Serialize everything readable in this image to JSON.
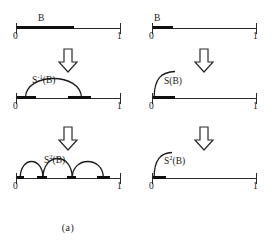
{
  "figure": {
    "axis": {
      "left_label": "0",
      "right_label": "1"
    },
    "arrow_icon": "down-block-arrow"
  },
  "panels": [
    {
      "id": "a",
      "caption": "(a)",
      "rows": [
        {
          "id": "a-row-1",
          "set_label": "B",
          "segments": [
            {
              "start": 0.0,
              "end": 0.56
            }
          ],
          "arcs": []
        },
        {
          "id": "a-row-2",
          "curve_label_main": "S",
          "curve_label_sup": "-1",
          "curve_label_arg": "(B)",
          "curve_label_plain": "S-1(B)",
          "segments": [
            {
              "start": 0.0,
              "end": 0.19
            },
            {
              "start": 0.5,
              "end": 0.72
            }
          ],
          "arcs": [
            {
              "start": 0.09,
              "end": 0.63,
              "height": 30
            }
          ]
        },
        {
          "id": "a-row-3",
          "curve_label_main": "S",
          "curve_label_sup": "2",
          "curve_label_arg": "(B)",
          "curve_label_plain": "S2(B)",
          "segments": [
            {
              "start": 0.0,
              "end": 0.08
            },
            {
              "start": 0.2,
              "end": 0.3
            },
            {
              "start": 0.49,
              "end": 0.58
            },
            {
              "start": 0.78,
              "end": 0.9
            }
          ],
          "arcs": [
            {
              "start": 0.04,
              "end": 0.26,
              "height": 26
            },
            {
              "start": 0.26,
              "end": 0.54,
              "height": 30
            },
            {
              "start": 0.54,
              "end": 0.84,
              "height": 26
            }
          ]
        }
      ]
    },
    {
      "id": "b",
      "caption": "(b)",
      "rows": [
        {
          "id": "b-row-1",
          "set_label": "B",
          "segments": [
            {
              "start": 0.0,
              "end": 0.2
            }
          ],
          "arcs": []
        },
        {
          "id": "b-row-2",
          "curve_label_main": "S",
          "curve_label_sup": "",
          "curve_label_arg": "(B)",
          "curve_label_plain": "S(B)",
          "segments": [
            {
              "start": 0.0,
              "end": 0.22
            }
          ],
          "hooks": [
            {
              "x": 0.02,
              "height": 28,
              "reach": 0.2
            }
          ]
        },
        {
          "id": "b-row-3",
          "curve_label_main": "S",
          "curve_label_sup": "2",
          "curve_label_arg": "(B)",
          "curve_label_plain": "S2(B)",
          "segments": [
            {
              "start": 0.0,
              "end": 0.13
            }
          ],
          "hooks": [
            {
              "x": 0.02,
              "height": 26,
              "reach": 0.16
            }
          ]
        }
      ]
    }
  ]
}
